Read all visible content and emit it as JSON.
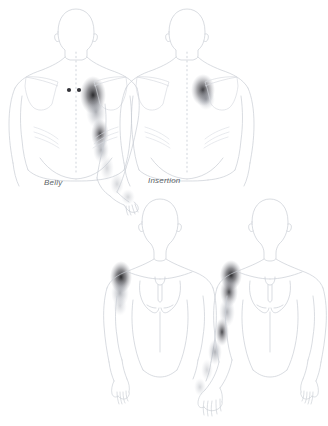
{
  "diagram": {
    "background_color": "#ffffff",
    "line_color": "#c9cdd4",
    "detail_line_color": "#d5d9df",
    "referral_color": "#2b2b2e",
    "label_color": "#5a5f66",
    "trigger_point_color": "#3a3a3f",
    "labels": [
      {
        "id": "belly",
        "text": "Belly"
      },
      {
        "id": "insertion",
        "text": "Insertion"
      }
    ],
    "figures": [
      {
        "id": "posterior-belly",
        "view": "posterior",
        "label": "Belly",
        "trigger_points": 2,
        "referral_zones": [
          "posterior deltoid",
          "lateral upper arm",
          "lateral elbow",
          "forearm",
          "hand"
        ]
      },
      {
        "id": "posterior-insertion",
        "view": "posterior",
        "label": "Insertion",
        "trigger_points": 0,
        "referral_zones": [
          "posterior deltoid"
        ]
      },
      {
        "id": "anterior-belly",
        "view": "anterior",
        "label": "",
        "trigger_points": 0,
        "referral_zones": [
          "anterior deltoid",
          "upper arm"
        ]
      },
      {
        "id": "anterior-insertion",
        "view": "anterior",
        "label": "",
        "trigger_points": 0,
        "referral_zones": [
          "anterior deltoid",
          "lateral arm",
          "forearm",
          "hand"
        ]
      }
    ]
  }
}
